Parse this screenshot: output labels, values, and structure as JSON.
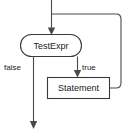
{
  "diagram": {
    "type": "flowchart",
    "background_color": "#ffffff",
    "line_color": "#4a4a4a",
    "shape_stroke_color": "#3a3a3a",
    "text_color": "#1a1a1a",
    "nodes": [
      {
        "id": "test-expr",
        "label": "TestExpr",
        "shape": "rounded-oval",
        "x": 20,
        "y": 34,
        "width": 62,
        "height": 23
      },
      {
        "id": "statement",
        "label": "Statement",
        "shape": "rectangle",
        "x": 47,
        "y": 77,
        "width": 63,
        "height": 22
      }
    ],
    "edge_labels": [
      {
        "id": "false-label",
        "text": "false",
        "x": 5,
        "y": 67
      },
      {
        "id": "true-label",
        "text": "true",
        "x": 79,
        "y": 67
      }
    ],
    "edges": [
      {
        "id": "entry-edge",
        "from": "top",
        "to": "test-expr",
        "arrow": true
      },
      {
        "id": "false-edge",
        "from": "test-expr",
        "to": "exit",
        "label": "false",
        "arrow": true
      },
      {
        "id": "true-edge",
        "from": "test-expr",
        "to": "statement",
        "label": "true",
        "arrow": true
      },
      {
        "id": "loopback-edge",
        "from": "statement",
        "to": "entry-edge",
        "arrow": false
      }
    ]
  }
}
